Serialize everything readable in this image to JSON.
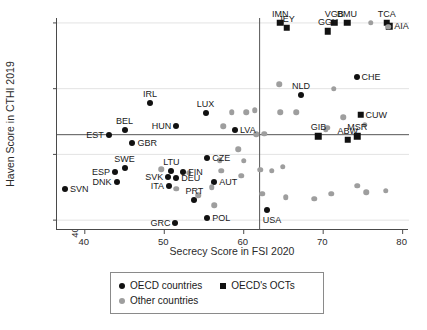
{
  "chart_data": {
    "type": "scatter",
    "title": "",
    "xlabel": "Secrecy Score in FSI 2020",
    "ylabel": "Haven Score in CTHI 2019",
    "xlim": [
      36.5,
      80.8
    ],
    "ylim": [
      37.0,
      101.5
    ],
    "xticks": [
      40,
      50,
      60,
      70,
      80
    ],
    "yticks": [
      40,
      60,
      80,
      100
    ],
    "grid": false,
    "reference_lines": {
      "x": 62.0,
      "y": 66.0
    },
    "legend_position": "bottom-outside",
    "series": [
      {
        "name": "OECD countries",
        "marker": "circle",
        "color": "#111111",
        "points": [
          {
            "label": "SVN",
            "x": 37.5,
            "y": 49.5,
            "lpos": "l"
          },
          {
            "label": "EST",
            "x": 43.0,
            "y": 66.0,
            "lpos": "r"
          },
          {
            "label": "DNK",
            "x": 44.0,
            "y": 51.5,
            "lpos": "r"
          },
          {
            "label": "ESP",
            "x": 43.8,
            "y": 54.5,
            "lpos": "r"
          },
          {
            "label": "BEL",
            "x": 45.0,
            "y": 67.5,
            "lpos": "c"
          },
          {
            "label": "SWE",
            "x": 45.0,
            "y": 55.8,
            "lpos": "c"
          },
          {
            "label": "GBR",
            "x": 46.0,
            "y": 63.5,
            "lpos": "l"
          },
          {
            "label": "IRL",
            "x": 48.2,
            "y": 75.5,
            "lpos": "c"
          },
          {
            "label": "SVK",
            "x": 50.5,
            "y": 53.0,
            "lpos": "r"
          },
          {
            "label": "ITA",
            "x": 50.6,
            "y": 50.5,
            "lpos": "r"
          },
          {
            "label": "LTU",
            "x": 50.9,
            "y": 55.0,
            "lpos": "c"
          },
          {
            "label": "DEU",
            "x": 51.5,
            "y": 52.8,
            "lpos": "l"
          },
          {
            "label": "HUN",
            "x": 51.5,
            "y": 68.5,
            "lpos": "r"
          },
          {
            "label": "GRC",
            "x": 51.4,
            "y": 39.0,
            "lpos": "r"
          },
          {
            "label": "FIN",
            "x": 52.4,
            "y": 54.5,
            "lpos": "l"
          },
          {
            "label": "PRT",
            "x": 53.8,
            "y": 46.0,
            "lpos": "c"
          },
          {
            "label": "LUX",
            "x": 55.2,
            "y": 72.5,
            "lpos": "c"
          },
          {
            "label": "CZE",
            "x": 55.4,
            "y": 59.0,
            "lpos": "l"
          },
          {
            "label": "POL",
            "x": 55.4,
            "y": 40.5,
            "lpos": "l"
          },
          {
            "label": "AUT",
            "x": 56.3,
            "y": 51.5,
            "lpos": "l"
          },
          {
            "label": "LVA",
            "x": 58.9,
            "y": 67.5,
            "lpos": "l"
          },
          {
            "label": "USA",
            "x": 62.9,
            "y": 43.0,
            "lpos": "rb"
          },
          {
            "label": "NLD",
            "x": 67.2,
            "y": 78.0,
            "lpos": "c"
          },
          {
            "label": "CHE",
            "x": 74.2,
            "y": 83.5,
            "lpos": "l"
          }
        ]
      },
      {
        "name": "OECD's OCTs",
        "marker": "square",
        "color": "#111111",
        "points": [
          {
            "label": "IMN",
            "x": 64.6,
            "y": 100.0,
            "lpos": "c"
          },
          {
            "label": "JEY",
            "x": 65.4,
            "y": 98.5,
            "lpos": "c"
          },
          {
            "label": "GGY",
            "x": 70.6,
            "y": 97.5,
            "lpos": "c"
          },
          {
            "label": "VGB",
            "x": 71.4,
            "y": 100.0,
            "lpos": "c"
          },
          {
            "label": "BMU",
            "x": 73.0,
            "y": 100.0,
            "lpos": "c"
          },
          {
            "label": "GIB",
            "x": 69.4,
            "y": 65.5,
            "lpos": "c"
          },
          {
            "label": "ABW",
            "x": 73.1,
            "y": 64.5,
            "lpos": "c"
          },
          {
            "label": "MSR",
            "x": 74.3,
            "y": 65.5,
            "lpos": "c"
          },
          {
            "label": "CUW",
            "x": 74.7,
            "y": 72.0,
            "lpos": "l"
          },
          {
            "label": "TCA",
            "x": 78.0,
            "y": 100.0,
            "lpos": "c"
          },
          {
            "label": "AIA",
            "x": 78.3,
            "y": 99.0,
            "lpos": "l"
          }
        ]
      },
      {
        "name": "Other countries",
        "marker": "circle",
        "color": "#9e9e9e",
        "points": [
          {
            "x": 49.6,
            "y": 55.5
          },
          {
            "x": 51.5,
            "y": 49.5
          },
          {
            "x": 53.1,
            "y": 54.4
          },
          {
            "x": 54.3,
            "y": 47.5
          },
          {
            "x": 56.0,
            "y": 50.0
          },
          {
            "x": 56.3,
            "y": 44.5
          },
          {
            "x": 57.0,
            "y": 58.2
          },
          {
            "x": 57.2,
            "y": 55.0
          },
          {
            "x": 57.4,
            "y": 68.6
          },
          {
            "x": 58.5,
            "y": 72.8
          },
          {
            "x": 59.3,
            "y": 61.5
          },
          {
            "x": 59.7,
            "y": 53.5
          },
          {
            "x": 60.0,
            "y": 58.0
          },
          {
            "x": 60.3,
            "y": 72.8
          },
          {
            "x": 61.4,
            "y": 73.4
          },
          {
            "x": 61.6,
            "y": 66.2
          },
          {
            "x": 62.1,
            "y": 55.3
          },
          {
            "x": 62.6,
            "y": 66.3
          },
          {
            "x": 62.3,
            "y": 48.0
          },
          {
            "x": 63.5,
            "y": 55.0
          },
          {
            "x": 64.5,
            "y": 81.3
          },
          {
            "x": 64.6,
            "y": 72.8
          },
          {
            "x": 64.9,
            "y": 56.3
          },
          {
            "x": 65.3,
            "y": 47.0
          },
          {
            "x": 66.6,
            "y": 72.8
          },
          {
            "x": 68.9,
            "y": 46.5
          },
          {
            "x": 70.3,
            "y": 67.5
          },
          {
            "x": 70.5,
            "y": 68.1
          },
          {
            "x": 71.3,
            "y": 80.0
          },
          {
            "x": 71.0,
            "y": 48.0
          },
          {
            "x": 72.5,
            "y": 71.3
          },
          {
            "x": 74.3,
            "y": 50.5
          },
          {
            "x": 75.2,
            "y": 69.0
          },
          {
            "x": 75.4,
            "y": 48.5
          },
          {
            "x": 76.0,
            "y": 100.0
          },
          {
            "x": 77.9,
            "y": 49.0
          },
          {
            "x": 78.2,
            "y": 98.8
          }
        ]
      }
    ]
  },
  "axes": {
    "y_title": "Haven Score in CTHI 2019",
    "x_title": "Secrecy Score in FSI 2020",
    "ytick_labels": [
      "40",
      "60",
      "80",
      "100"
    ],
    "xtick_labels": [
      "40",
      "50",
      "60",
      "70",
      "80"
    ]
  },
  "legend": {
    "oecd_label": "OECD countries",
    "oct_label": "OECD's OCTs",
    "other_label": "Other countries"
  },
  "colors": {
    "oecd": "#111111",
    "oct": "#111111",
    "other": "#9e9e9e",
    "axis": "#4a4a4a",
    "refline": "#555555"
  }
}
